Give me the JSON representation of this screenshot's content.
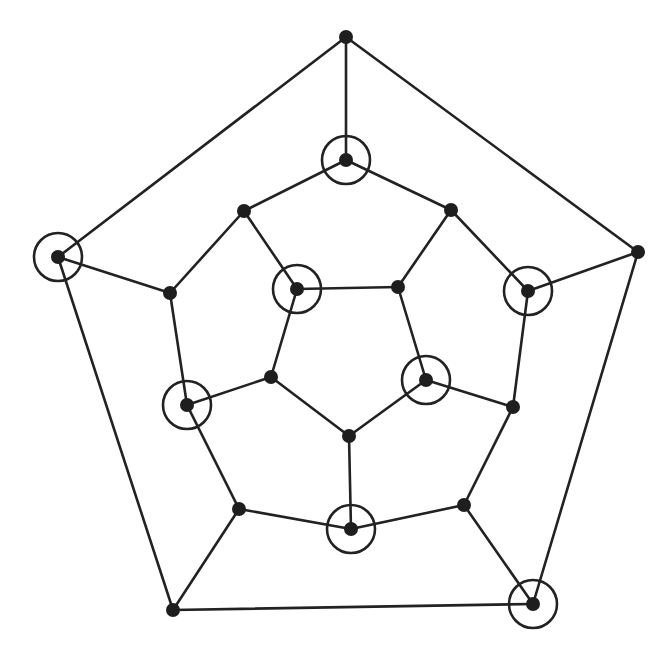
{
  "figure": {
    "width": 671,
    "height": 652,
    "colors": {
      "background": "#ffffff",
      "stroke": "#222222",
      "vertex_fill": "#1e1e1e"
    },
    "vertex_radius": 7,
    "ring_radius": 24
  },
  "graph": {
    "vertices": [
      {
        "id": "o1",
        "ring": "outer",
        "x": 346,
        "y": 37,
        "marked": false
      },
      {
        "id": "o2",
        "ring": "outer",
        "x": 638,
        "y": 252,
        "marked": false
      },
      {
        "id": "o3",
        "ring": "outer",
        "x": 533,
        "y": 604,
        "marked": true
      },
      {
        "id": "o4",
        "ring": "outer",
        "x": 173,
        "y": 610,
        "marked": false
      },
      {
        "id": "o5",
        "ring": "outer",
        "x": 58,
        "y": 257,
        "marked": true
      },
      {
        "id": "m1",
        "ring": "middle",
        "x": 346,
        "y": 160,
        "marked": true
      },
      {
        "id": "m2",
        "ring": "middle",
        "x": 451,
        "y": 210,
        "marked": false
      },
      {
        "id": "m3",
        "ring": "middle",
        "x": 528,
        "y": 291,
        "marked": true
      },
      {
        "id": "m4",
        "ring": "middle",
        "x": 513,
        "y": 407,
        "marked": false
      },
      {
        "id": "m5",
        "ring": "middle",
        "x": 464,
        "y": 505,
        "marked": false
      },
      {
        "id": "m6",
        "ring": "middle",
        "x": 351,
        "y": 529,
        "marked": true
      },
      {
        "id": "m7",
        "ring": "middle",
        "x": 239,
        "y": 509,
        "marked": false
      },
      {
        "id": "m8",
        "ring": "middle",
        "x": 187,
        "y": 405,
        "marked": true
      },
      {
        "id": "m9",
        "ring": "middle",
        "x": 170,
        "y": 293,
        "marked": false
      },
      {
        "id": "m10",
        "ring": "middle",
        "x": 244,
        "y": 211,
        "marked": false
      },
      {
        "id": "i1",
        "ring": "inner",
        "x": 297,
        "y": 289,
        "marked": true
      },
      {
        "id": "i2",
        "ring": "inner",
        "x": 398,
        "y": 287,
        "marked": false
      },
      {
        "id": "i3",
        "ring": "inner",
        "x": 426,
        "y": 380,
        "marked": true
      },
      {
        "id": "i4",
        "ring": "inner",
        "x": 349,
        "y": 436,
        "marked": false
      },
      {
        "id": "i5",
        "ring": "inner",
        "x": 271,
        "y": 377,
        "marked": false
      }
    ],
    "edges": [
      [
        "o1",
        "o2"
      ],
      [
        "o2",
        "o3"
      ],
      [
        "o3",
        "o4"
      ],
      [
        "o4",
        "o5"
      ],
      [
        "o5",
        "o1"
      ],
      [
        "o1",
        "m1"
      ],
      [
        "o2",
        "m3"
      ],
      [
        "o3",
        "m5"
      ],
      [
        "o4",
        "m7"
      ],
      [
        "o5",
        "m9"
      ],
      [
        "m1",
        "m2"
      ],
      [
        "m2",
        "m3"
      ],
      [
        "m3",
        "m4"
      ],
      [
        "m4",
        "m5"
      ],
      [
        "m5",
        "m6"
      ],
      [
        "m6",
        "m7"
      ],
      [
        "m7",
        "m8"
      ],
      [
        "m8",
        "m9"
      ],
      [
        "m9",
        "m10"
      ],
      [
        "m10",
        "m1"
      ],
      [
        "m10",
        "i1"
      ],
      [
        "m2",
        "i2"
      ],
      [
        "m4",
        "i3"
      ],
      [
        "m6",
        "i4"
      ],
      [
        "m8",
        "i5"
      ],
      [
        "i1",
        "i2"
      ],
      [
        "i2",
        "i3"
      ],
      [
        "i3",
        "i4"
      ],
      [
        "i4",
        "i5"
      ],
      [
        "i5",
        "i1"
      ]
    ],
    "stats": {
      "vertex_count": 20,
      "edge_count": 30,
      "marked_count": 8
    }
  }
}
